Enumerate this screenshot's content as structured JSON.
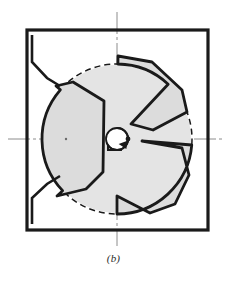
{
  "figure": {
    "caption": "(b)",
    "colors": {
      "ink": "#1a1a1a",
      "vane_fill": "#dcdcdc",
      "disc_fill": "#e4e4e4",
      "centerline": "#8c8c8c",
      "paper": "#ffffff"
    },
    "housing": {
      "name": "square housing outline",
      "left": 27,
      "top": 30,
      "right": 208,
      "bottom": 230,
      "stroke_width": 3.2
    },
    "reference_circle": {
      "name": "dashed pitch circle",
      "cx": 117,
      "cy": 139,
      "r": 75,
      "dash": "6 4",
      "stroke_width": 1.5
    },
    "rotor_disc": {
      "name": "rotor disc",
      "cx": 117,
      "cy": 139,
      "r": 74
    },
    "hub": {
      "name": "center hub",
      "cx": 117,
      "cy": 139,
      "r": 11,
      "shaft_dot_r": 2.4,
      "rotation_arrow": "clockwise"
    },
    "centerlines": {
      "horizontal": {
        "x1": 8,
        "y1": 139,
        "x2": 222,
        "y2": 139
      },
      "vertical": {
        "x1": 117,
        "y1": 12,
        "x2": 117,
        "y2": 246
      }
    },
    "vanes": [
      {
        "id": "vane-left",
        "label": "left vane",
        "points": "56,86 73,82 104,101 103,172 86,189 57,196"
      },
      {
        "id": "vane-upper-right",
        "label": "upper right vane",
        "points": "118,56 152,62 182,90 187,112 153,130 131,124"
      },
      {
        "id": "vane-lower-right",
        "label": "lower right vane",
        "points": "142,141 182,148 189,175 175,204 150,213 117,196"
      }
    ],
    "corner_marks": [
      {
        "id": "mark-top-left",
        "label": "upper inlet lip",
        "points": "32,35 32,62 47,78 60,86"
      },
      {
        "id": "mark-bottom-left",
        "label": "lower inlet lip",
        "points": "32,224 32,198 47,184 60,176"
      }
    ]
  }
}
